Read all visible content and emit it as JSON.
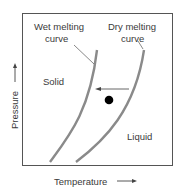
{
  "diagram": {
    "labels": {
      "wet_curve_line1": "Wet melting",
      "wet_curve_line2": "curve",
      "dry_curve_line1": "Dry melting",
      "dry_curve_line2": "curve",
      "solid": "Solid",
      "liquid": "Liquid",
      "x_axis": "Temperature",
      "y_axis": "Pressure"
    },
    "colors": {
      "curve": "#8a8a8a",
      "frame": "#555555",
      "text": "#3a3a3a",
      "point": "#000000"
    }
  }
}
